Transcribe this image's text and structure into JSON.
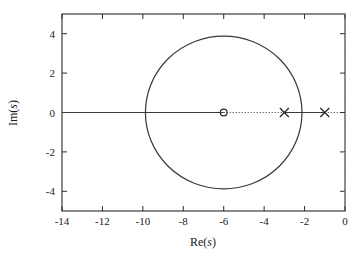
{
  "chart_data": {
    "type": "scatter",
    "title": "",
    "subtitle": "",
    "xlabel_prefix": "Re(",
    "xlabel_var": "s",
    "xlabel_suffix": ")",
    "ylabel_prefix": "Im(",
    "ylabel_var": "s",
    "ylabel_suffix": ")",
    "xlim": [
      -14,
      0
    ],
    "ylim": [
      -5,
      5
    ],
    "grid": false,
    "legend": "none",
    "xticks": [
      {
        "value": -14,
        "label": "-14"
      },
      {
        "value": -12,
        "label": "-12"
      },
      {
        "value": -10,
        "label": "-10"
      },
      {
        "value": -8,
        "label": "-8"
      },
      {
        "value": -6,
        "label": "-6"
      },
      {
        "value": -4,
        "label": "-4"
      },
      {
        "value": -2,
        "label": "-2"
      },
      {
        "value": 0,
        "label": "0"
      }
    ],
    "yticks": [
      {
        "value": 4,
        "label": "4"
      },
      {
        "value": 2,
        "label": "2"
      },
      {
        "value": 0,
        "label": "0"
      },
      {
        "value": -2,
        "label": "-2"
      },
      {
        "value": -4,
        "label": "-4"
      }
    ],
    "poles": [
      {
        "re": -1,
        "im": 0,
        "marker": "x"
      },
      {
        "re": -3,
        "im": 0,
        "marker": "x"
      }
    ],
    "zeros": [
      {
        "re": -6,
        "im": 0,
        "marker": "o"
      }
    ],
    "locus_circle": {
      "center_re": -6,
      "center_im": 0,
      "radius": 3.873
    },
    "locus_segments": [
      {
        "style": "solid",
        "from_re": -14,
        "to_re": -6,
        "im": 0
      },
      {
        "style": "dotted",
        "from_re": -6,
        "to_re": -3,
        "im": 0
      },
      {
        "style": "solid",
        "from_re": -3,
        "to_re": -1,
        "im": 0
      },
      {
        "style": "dotted",
        "from_re": -1,
        "to_re": 0,
        "im": 0
      }
    ],
    "imaginary_axis_line": {
      "re": 0,
      "style": "dotted"
    },
    "colors": {
      "curve": "#3a3a3a",
      "frame": "#2b2b2b",
      "text": "#1a1a1a",
      "imag_axis": "#9a9a9a",
      "background": "#ffffff"
    }
  },
  "plot": {
    "x_axis_title": "Re(s)",
    "y_axis_title": "Im(s)"
  }
}
